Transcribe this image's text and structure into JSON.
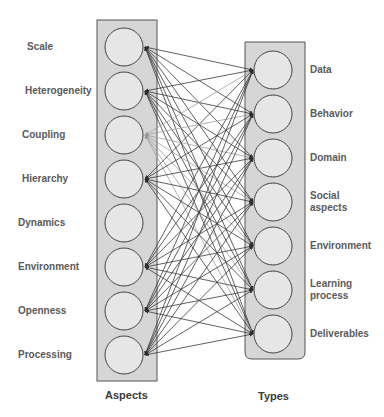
{
  "diagram": {
    "left_column": {
      "title": "Aspects",
      "items": [
        {
          "label": "Scale",
          "arrow": "dark"
        },
        {
          "label": "Heterogeneity",
          "arrow": "dark"
        },
        {
          "label": "Coupling",
          "arrow": "light"
        },
        {
          "label": "Hierarchy",
          "arrow": "dark"
        },
        {
          "label": "Dynamics",
          "arrow": "none"
        },
        {
          "label": "Environment",
          "arrow": "dark"
        },
        {
          "label": "Openness",
          "arrow": "dark"
        },
        {
          "label": "Processing",
          "arrow": "dark"
        }
      ]
    },
    "right_column": {
      "title": "Types",
      "items": [
        {
          "label": "Data"
        },
        {
          "label": "Behavior"
        },
        {
          "label": "Domain"
        },
        {
          "label": "Social aspects",
          "lines": [
            "Social",
            "aspects"
          ]
        },
        {
          "label": "Environment"
        },
        {
          "label": "Learning process",
          "lines": [
            "Learning",
            "process"
          ]
        },
        {
          "label": "Deliverables"
        }
      ]
    },
    "connections": "all-to-all bidirectional arrows between each left aspect and each right type",
    "colors": {
      "box_fill": "#d6d6d6",
      "box_stroke": "#555555",
      "circle_fill": "#e6e6e6",
      "circle_stroke": "#444444",
      "line_dark": "#3a3a3a",
      "line_light": "#a0a0a0",
      "label_text": "#5a5a5a"
    }
  }
}
